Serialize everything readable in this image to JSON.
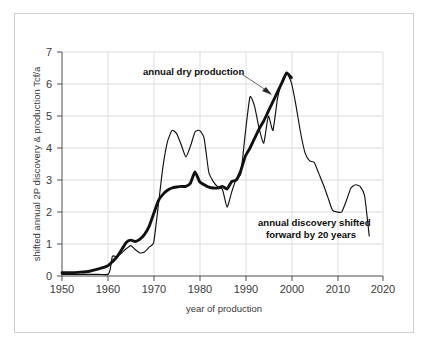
{
  "figure": {
    "border_color": "#cfcfcf",
    "background": "#ffffff"
  },
  "chart_data": {
    "type": "line",
    "title": "",
    "xlabel": "year of production",
    "ylabel": "shifted annual 2P discovery & production Tcf/a",
    "xlim": [
      1950,
      2020
    ],
    "ylim": [
      0,
      7
    ],
    "xticks": [
      "1950",
      "1960",
      "1970",
      "1980",
      "1990",
      "2000",
      "2010",
      "2020"
    ],
    "yticks": [
      "0",
      "1",
      "2",
      "3",
      "4",
      "5",
      "6",
      "7"
    ],
    "grid": true,
    "legend": "none",
    "annotations": [
      {
        "name": "annual-dry-production-annotation",
        "text": "annual dry production",
        "points_to_series": "annual dry production"
      },
      {
        "name": "annual-discovery-annotation",
        "line1": "annual discovery shifted",
        "line2": "forward by 20 years",
        "points_to_series": "annual discovery shifted forward by 20 years"
      }
    ],
    "series": [
      {
        "name": "annual dry production",
        "style": "thick",
        "color": "#111111",
        "x": [
          1950,
          1952,
          1954,
          1956,
          1958,
          1960,
          1961,
          1962,
          1963,
          1964,
          1965,
          1966,
          1967,
          1968,
          1969,
          1970,
          1971,
          1972,
          1973,
          1974,
          1975,
          1976,
          1977,
          1978,
          1979,
          1980,
          1981,
          1982,
          1983,
          1984,
          1985,
          1986,
          1987,
          1988,
          1989,
          1990,
          1991,
          1992,
          1993,
          1994,
          1995,
          1996,
          1997,
          1998,
          1999,
          2000
        ],
        "y": [
          0.1,
          0.1,
          0.12,
          0.15,
          0.22,
          0.32,
          0.45,
          0.6,
          0.82,
          1.05,
          1.12,
          1.08,
          1.15,
          1.3,
          1.55,
          1.95,
          2.35,
          2.55,
          2.68,
          2.75,
          2.78,
          2.8,
          2.8,
          2.9,
          3.25,
          2.95,
          2.85,
          2.78,
          2.75,
          2.75,
          2.8,
          2.72,
          2.95,
          3.0,
          3.3,
          3.75,
          4.0,
          4.3,
          4.6,
          4.85,
          5.15,
          5.45,
          5.75,
          6.05,
          6.35,
          6.2
        ]
      },
      {
        "name": "annual discovery shifted forward by 20 years",
        "style": "thin",
        "color": "#111111",
        "x": [
          1950,
          1955,
          1958,
          1960,
          1960.5,
          1961,
          1962,
          1963,
          1964,
          1965,
          1966,
          1967,
          1968,
          1969,
          1970,
          1971,
          1972,
          1973,
          1974,
          1975,
          1976,
          1977,
          1978,
          1979,
          1980,
          1981,
          1982,
          1983,
          1984,
          1985,
          1986,
          1987,
          1988,
          1989,
          1990,
          1991,
          1992,
          1993,
          1994,
          1995,
          1996,
          1997,
          1998,
          1999,
          2000,
          2001,
          2002,
          2003,
          2004,
          2005,
          2006,
          2007,
          2008,
          2009,
          2010,
          2011,
          2012,
          2013,
          2014,
          2015,
          2016,
          2017
        ],
        "y": [
          0.05,
          0.05,
          0.05,
          0.05,
          0.2,
          0.62,
          0.6,
          0.72,
          0.85,
          0.95,
          0.82,
          0.72,
          0.75,
          0.9,
          1.05,
          2.2,
          3.4,
          4.2,
          4.55,
          4.45,
          4.1,
          3.72,
          4.05,
          4.5,
          4.55,
          4.3,
          3.25,
          2.95,
          2.78,
          2.7,
          2.15,
          2.62,
          3.05,
          3.2,
          4.5,
          5.6,
          5.3,
          4.6,
          4.15,
          5.0,
          4.55,
          5.55,
          6.1,
          6.35,
          6.05,
          5.35,
          4.5,
          3.85,
          3.6,
          3.55,
          3.2,
          2.85,
          2.45,
          2.05,
          2.0,
          2.0,
          2.35,
          2.75,
          2.85,
          2.8,
          2.5,
          1.25
        ]
      }
    ]
  }
}
